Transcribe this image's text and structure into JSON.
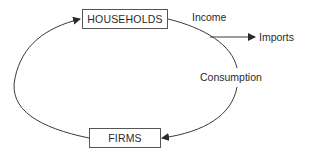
{
  "diagram": {
    "nodes": [
      {
        "id": "households",
        "label": "HOUSEHOLDS"
      },
      {
        "id": "firms",
        "label": "FIRMS"
      }
    ],
    "edges": [
      {
        "from": "households",
        "to": "firms",
        "label": "Income"
      },
      {
        "from": "income-flow",
        "to": "imports",
        "label": "Imports"
      },
      {
        "from": "households",
        "to": "firms",
        "label": "Consumption"
      },
      {
        "from": "firms",
        "to": "households",
        "label": ""
      }
    ],
    "labels": {
      "income": "Income",
      "imports": "Imports",
      "consumption": "Consumption"
    },
    "colors": {
      "line": "#3a3a3a",
      "box_border": "#555555",
      "text": "#2a2a2a"
    }
  }
}
